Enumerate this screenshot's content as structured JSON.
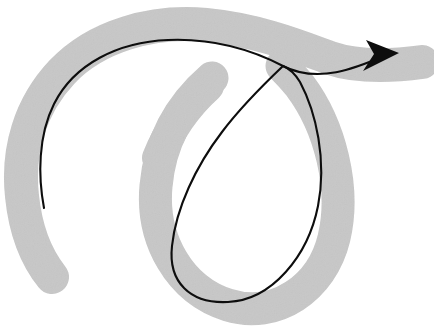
{
  "figure": {
    "kind": "gesture-path-sketch",
    "title": "Spiral gesture path with arrowhead",
    "canvas": {
      "width": 434,
      "height": 333,
      "background": "#ffffff"
    },
    "colors": {
      "highlight_gray": "#e2e2e2",
      "highlight_gray_edge": "#dcdcdc",
      "ink_black": "#0d0d0d",
      "background_white": "#ffffff"
    },
    "strokes": {
      "highlight": {
        "name": "gray-highlight-spiral",
        "color": "#e2e2e2",
        "width": 34,
        "description": "thick light gray marker spiral sweeping counter-clockwise from lower-left tail, around the top, crossing itself, then looping clockwise down and around to exit right",
        "start_point": [
          52,
          277
        ],
        "end_point": [
          424,
          62
        ],
        "crossing_point": [
          283,
          66
        ]
      },
      "ink": {
        "name": "black-arrow-curve",
        "color": "#0d0d0d",
        "width": 2.1,
        "description": "thin black pen line traced inside the gray stroke, ending in a solid arrowhead pointing right",
        "start_point": [
          44,
          208
        ],
        "tip_point": [
          399,
          53
        ],
        "crossing_point": [
          283,
          66
        ]
      },
      "arrowhead": {
        "name": "arrow-head",
        "color": "#0d0d0d",
        "tip": [
          399,
          53
        ],
        "length": 30,
        "half_width": 11
      }
    },
    "geometry": {
      "outer_arc_bbox": [
        10,
        22,
        300,
        290
      ],
      "loop_bbox": [
        140,
        50,
        348,
        318
      ],
      "loop_center": [
        244,
        185
      ],
      "loop_radius_x": 90,
      "loop_radius_y": 118,
      "tail_cap": [
        52,
        277
      ],
      "exit_cap": [
        424,
        62
      ]
    }
  }
}
